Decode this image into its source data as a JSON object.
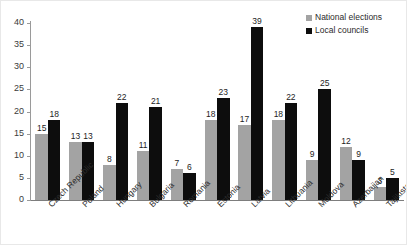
{
  "chart_data": {
    "type": "bar",
    "title": "",
    "subtitle": "",
    "xlabel": "",
    "ylabel": "",
    "ylim": [
      0,
      40
    ],
    "y_ticks": [
      0,
      5,
      10,
      15,
      20,
      25,
      30,
      35,
      40
    ],
    "grid": false,
    "legend_position": "top-right",
    "categories": [
      "Czech Republic",
      "Poland",
      "Hungary",
      "Bulgaria",
      "Romania",
      "Estonia",
      "Latvia",
      "Lithuania",
      "Moldova",
      "Azerbaijan",
      "Tajikistan"
    ],
    "series": [
      {
        "name": "National elections",
        "color": "#a3a3a3",
        "values": [
          15,
          13,
          8,
          11,
          7,
          18,
          17,
          18,
          9,
          12,
          3
        ]
      },
      {
        "name": "Local councils",
        "color": "#0d0d0d",
        "values": [
          18,
          13,
          22,
          21,
          6,
          23,
          39,
          22,
          25,
          9,
          5
        ]
      }
    ]
  }
}
